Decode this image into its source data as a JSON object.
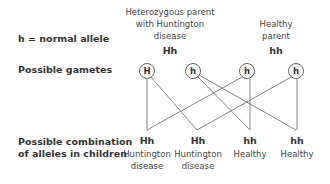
{
  "legend": {
    "text": "h = normal allele"
  },
  "row_labels": {
    "gametes": "Possible gametes",
    "combination_line1": "Possible combination",
    "combination_line2": "of alleles in children"
  },
  "parents": [
    {
      "title_lines": [
        "Heterozygous parent",
        "with Huntington",
        "disease"
      ],
      "genotype": "Hh"
    },
    {
      "title_lines": [
        "Healthy",
        "parent"
      ],
      "genotype": "hh"
    }
  ],
  "gametes": [
    "H",
    "h",
    "h",
    "h"
  ],
  "connections": [
    [
      0,
      0
    ],
    [
      0,
      1
    ],
    [
      1,
      2
    ],
    [
      1,
      3
    ],
    [
      2,
      0
    ],
    [
      2,
      2
    ],
    [
      3,
      1
    ],
    [
      3,
      3
    ]
  ],
  "children": [
    {
      "genotype": "Hh",
      "phenotype_lines": [
        "Huntington",
        "disease"
      ]
    },
    {
      "genotype": "Hh",
      "phenotype_lines": [
        "Huntington",
        "disease"
      ]
    },
    {
      "genotype": "hh",
      "phenotype_lines": [
        "Healthy"
      ]
    },
    {
      "genotype": "hh",
      "phenotype_lines": [
        "Healthy"
      ]
    }
  ]
}
